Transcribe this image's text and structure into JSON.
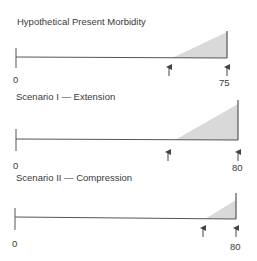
{
  "panels": [
    {
      "title": "Hypothetical Present Morbidity",
      "start_label": "0",
      "end_label": "75",
      "morbidity_onset_arrow": true,
      "death_arrow": true
    },
    {
      "title": "Scenario I — Extension",
      "start_label": "0",
      "end_label": "80",
      "morbidity_onset_arrow": true,
      "death_arrow": true
    },
    {
      "title": "Scenario II — Compression",
      "start_label": "0",
      "end_label": "80",
      "morbidity_onset_arrow": true,
      "death_arrow": true
    }
  ],
  "colors": {
    "line": "#555555",
    "fill": "#d9d9d9"
  }
}
